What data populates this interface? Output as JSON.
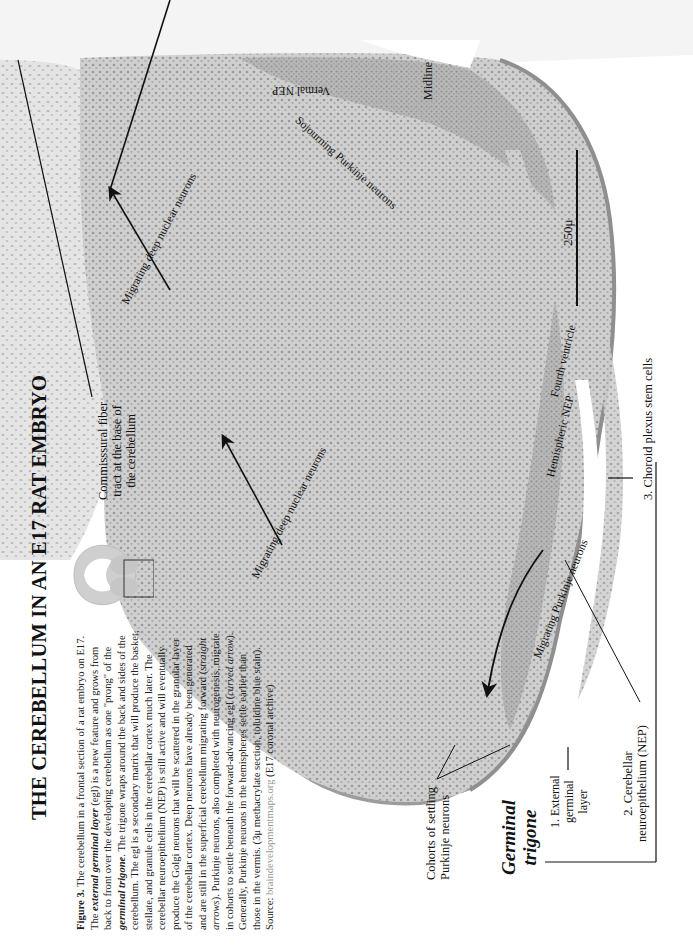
{
  "page": {
    "title": "THE CEREBELLUM IN AN E17 RAT EMBRYO",
    "orientation": "rotated 90 degrees counterclockwise"
  },
  "caption": {
    "figure_label": "Figure 3.",
    "segments": [
      {
        "text": " The cerebellum in a frontal section of a rat embryo on E17.  The ",
        "style": "normal"
      },
      {
        "text": "external germinal layer",
        "style": "bold-italic"
      },
      {
        "text": " (egl) is a new feature and grows from back to front over the developing cerebellum as one \"prong\" of the ",
        "style": "normal"
      },
      {
        "text": "germinal trigone",
        "style": "bold-italic"
      },
      {
        "text": ".  The trigone wraps around the back and sides of the cerebellum.  The egl is a secondary matrix that will produce the basket, stellate, and granule cells in the cerebellar cortex much later.  The cerebellar neuroepithelium (NEP) is still active and will eventually produce the Golgi neurons that will be scattered in the granular layer of the cerebellar cortex.  Deep neurons have already been generated and are still in the superficial cerebellum migrating forward (",
        "style": "normal"
      },
      {
        "text": "straight arrows",
        "style": "italic"
      },
      {
        "text": ").  Purkinje neurons, also completed with neurogenesis,  migrate in cohorts to settle beneath the forward-advancing egl (",
        "style": "normal"
      },
      {
        "text": "curved arrow",
        "style": "italic"
      },
      {
        "text": ").  Generally,  Purkinje neurons in the hemispheres settle earlier than those in the vermis. (3μ methacrylate section, toluidine blue stain). Source: ",
        "style": "normal"
      },
      {
        "text": "braindevelopmentmaps.org",
        "style": "link"
      },
      {
        "text": " (E17 coronal archive)",
        "style": "normal"
      }
    ]
  },
  "labels": {
    "commissural": [
      "Commisssural fiber",
      "tract at the base of",
      "the cerebellum"
    ],
    "migrating_deep_1": "Migrating deep nuclear neurons",
    "migrating_deep_2": "Migrating deep nuclear neurons",
    "migrating_purkinje": "Migrating Purkinje neurons",
    "sojourning_purkinje": "Sojourning Purkinje neurons",
    "vermal_nep": "Vermal NEP",
    "midline": "Midline",
    "hemispheric_nep": "Hemispheric NEP",
    "fourth_ventricle": "Fourth ventricle",
    "choroid_plexus": "3. Choroid plexus stem cells",
    "scale_bar": "250μ",
    "cohorts": [
      "Cohorts of settling",
      "Purkinje neurons"
    ],
    "germinal_trigone": [
      "Germinal",
      "trigone"
    ],
    "external_germinal": [
      "1. External",
      "germinal",
      "layer"
    ],
    "cerebellar_nep": [
      "2. Cerebellar",
      "neuroepithelium (NEP)"
    ]
  },
  "colors": {
    "background": "#ffffff",
    "tissue_light": "#d9d9d9",
    "tissue_mid": "#bdbdbd",
    "tissue_dark": "#9e9e9e",
    "ink": "#111111",
    "source_link": "#9a9a9a"
  }
}
